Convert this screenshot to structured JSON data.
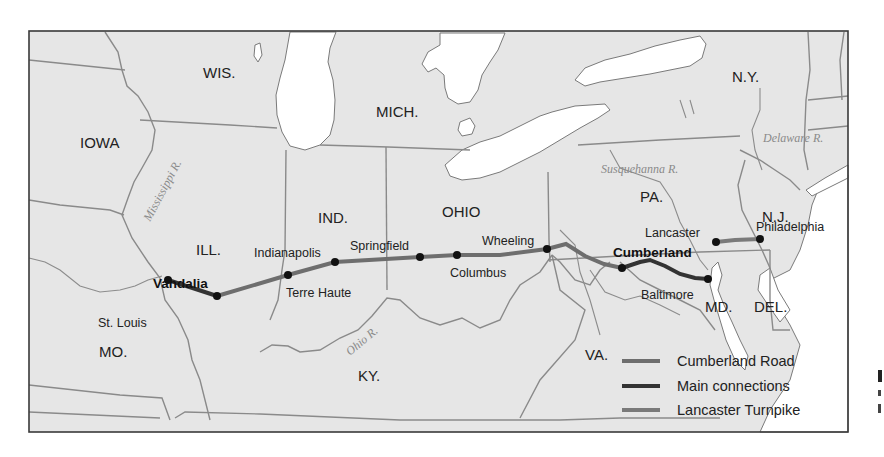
{
  "map": {
    "colors": {
      "land": "#e6e6e6",
      "water": "#ffffff",
      "border": "#8a8a8a",
      "cumberland_road": "#6e6e6e",
      "main_connections": "#333333",
      "lancaster_turnpike": "#7a7a7a",
      "city_dot": "#111111"
    },
    "states": [
      {
        "id": "wis",
        "label": "WIS."
      },
      {
        "id": "iowa",
        "label": "IOWA"
      },
      {
        "id": "mich",
        "label": "MICH."
      },
      {
        "id": "ny",
        "label": "N.Y."
      },
      {
        "id": "ill",
        "label": "ILL."
      },
      {
        "id": "ind",
        "label": "IND."
      },
      {
        "id": "ohio",
        "label": "OHIO"
      },
      {
        "id": "pa",
        "label": "PA."
      },
      {
        "id": "nj",
        "label": "N.J."
      },
      {
        "id": "mo",
        "label": "MO."
      },
      {
        "id": "ky",
        "label": "KY."
      },
      {
        "id": "va",
        "label": "VA."
      },
      {
        "id": "md",
        "label": "MD."
      },
      {
        "id": "del",
        "label": "DEL."
      }
    ],
    "rivers": [
      {
        "id": "mississippi",
        "label": "Mississippi R."
      },
      {
        "id": "ohio",
        "label": "Ohio R."
      },
      {
        "id": "susquehanna",
        "label": "Susquehanna R."
      },
      {
        "id": "delaware",
        "label": "Delaware R."
      }
    ],
    "cities": [
      {
        "id": "st-louis",
        "label": "St. Louis",
        "bold": false
      },
      {
        "id": "vandalia",
        "label": "Vandalia",
        "bold": true
      },
      {
        "id": "terre-haute",
        "label": "Terre Haute",
        "bold": false
      },
      {
        "id": "indianapolis",
        "label": "Indianapolis",
        "bold": false
      },
      {
        "id": "springfield",
        "label": "Springfield",
        "bold": false
      },
      {
        "id": "columbus",
        "label": "Columbus",
        "bold": false
      },
      {
        "id": "wheeling",
        "label": "Wheeling",
        "bold": false
      },
      {
        "id": "cumberland",
        "label": "Cumberland",
        "bold": true
      },
      {
        "id": "baltimore",
        "label": "Baltimore",
        "bold": false
      },
      {
        "id": "lancaster",
        "label": "Lancaster",
        "bold": false
      },
      {
        "id": "philadelphia",
        "label": "Philadelphia",
        "bold": false
      }
    ],
    "legend": [
      {
        "id": "cumberland-road",
        "label": "Cumberland Road"
      },
      {
        "id": "main-connections",
        "label": "Main connections"
      },
      {
        "id": "lancaster-turnpike",
        "label": "Lancaster Turnpike"
      }
    ]
  }
}
